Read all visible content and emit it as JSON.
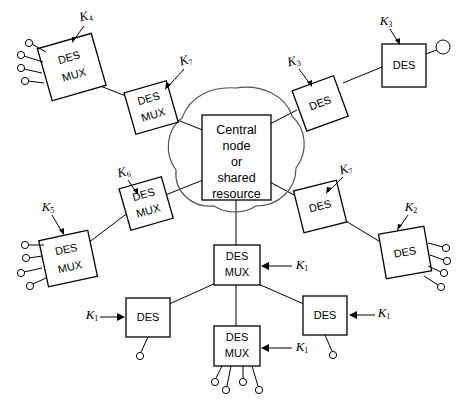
{
  "diagram": {
    "central": {
      "name": "central-node",
      "lines": [
        "Central",
        "node",
        "or",
        "shared",
        "resource"
      ],
      "full_text": "Central node or shared resource"
    },
    "labels": {
      "des": "DES",
      "mux_line1": "DES",
      "mux_line2": "MUX"
    },
    "keys": {
      "k1": "K",
      "k1_sub": "1",
      "k2": "K",
      "k2_sub": "2",
      "k3": "K",
      "k3_sub": "3",
      "k4": "K",
      "k4_sub": "4",
      "k5": "K",
      "k5_sub": "5",
      "k6": "K",
      "k6_sub": "6",
      "k7": "K",
      "k7_sub": "7"
    },
    "nodes": [
      {
        "id": "desmux-upper-left",
        "type": "DES MUX",
        "key": "K4",
        "terminals": 4
      },
      {
        "id": "desmux-upper-mid",
        "type": "DES MUX",
        "key": "K7",
        "terminals": 0
      },
      {
        "id": "des-upper-right",
        "type": "DES",
        "key": "K3",
        "terminals": 0
      },
      {
        "id": "des-top-right",
        "type": "DES",
        "key": "K3",
        "terminals": 1
      },
      {
        "id": "desmux-left-mid",
        "type": "DES MUX",
        "key": "K6",
        "terminals": 0
      },
      {
        "id": "desmux-left-lower",
        "type": "DES MUX",
        "key": "K5",
        "terminals": 4
      },
      {
        "id": "des-right-mid",
        "type": "DES",
        "key": "K7",
        "terminals": 0
      },
      {
        "id": "des-right-lower",
        "type": "DES",
        "key": "K2",
        "terminals": 4
      },
      {
        "id": "desmux-center-bottom",
        "type": "DES MUX",
        "key": "K1",
        "terminals": 0
      },
      {
        "id": "des-bottom-left",
        "type": "DES",
        "key": "K1",
        "terminals": 1
      },
      {
        "id": "des-bottom-right",
        "type": "DES",
        "key": "K1",
        "terminals": 1
      },
      {
        "id": "desmux-bottom",
        "type": "DES MUX",
        "key": "K1",
        "terminals": 4
      }
    ],
    "colors": {
      "stroke": "#000000",
      "cloud": "#555555",
      "background": "#ffffff"
    }
  }
}
